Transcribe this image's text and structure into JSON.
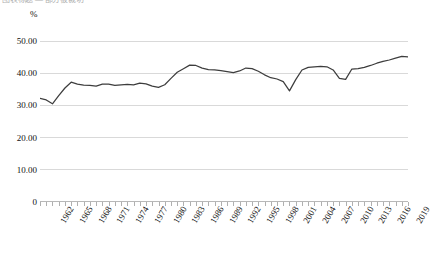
{
  "title_partial": "图表标题 — 部分被裁切",
  "axis_unit_label": "%",
  "y_labels": [
    "50.00",
    "40.00",
    "30.00",
    "20.00",
    "10.00",
    "0"
  ],
  "x_labels": [
    "1962",
    "1965",
    "1968",
    "1971",
    "1974",
    "1977",
    "1980",
    "1983",
    "1986",
    "1989",
    "1992",
    "1995",
    "1998",
    "2001",
    "2004",
    "2007",
    "2010",
    "2013",
    "2016",
    "2019"
  ],
  "colors": {
    "line": "#3d3d3d",
    "grid": "#d9d9d9",
    "axis": "#b8b8b8",
    "text": "#111111"
  },
  "chart_data": {
    "type": "line",
    "title": "",
    "xlabel": "",
    "ylabel": "%",
    "ylim": [
      0,
      50
    ],
    "ytick_values": [
      50,
      40,
      30,
      20,
      10,
      0
    ],
    "ytick_labels": [
      "50.00",
      "40.00",
      "30.00",
      "20.00",
      "10.00",
      "0"
    ],
    "grid": true,
    "grid_axis": "y",
    "legend": false,
    "xtick_interval_years": 3,
    "x": [
      1961,
      1962,
      1963,
      1964,
      1965,
      1966,
      1967,
      1968,
      1969,
      1970,
      1971,
      1972,
      1973,
      1974,
      1975,
      1976,
      1977,
      1978,
      1979,
      1980,
      1981,
      1982,
      1983,
      1984,
      1985,
      1986,
      1987,
      1988,
      1989,
      1990,
      1991,
      1992,
      1993,
      1994,
      1995,
      1996,
      1997,
      1998,
      1999,
      2000,
      2001,
      2002,
      2003,
      2004,
      2005,
      2006,
      2007,
      2008,
      2009,
      2010,
      2011,
      2012,
      2013,
      2014,
      2015,
      2016,
      2017,
      2018,
      2019,
      2020
    ],
    "values": [
      32.2,
      31.7,
      30.5,
      33.0,
      35.4,
      37.2,
      36.6,
      36.3,
      36.2,
      36.0,
      36.6,
      36.6,
      36.2,
      36.4,
      36.5,
      36.4,
      36.9,
      36.7,
      36.0,
      35.6,
      36.4,
      38.4,
      40.3,
      41.4,
      42.5,
      42.4,
      41.6,
      41.1,
      41.0,
      40.8,
      40.5,
      40.2,
      40.7,
      41.6,
      41.4,
      40.6,
      39.5,
      38.6,
      38.2,
      37.4,
      34.5,
      38.0,
      41.0,
      41.8,
      42.0,
      42.1,
      42.0,
      41.0,
      38.4,
      38.1,
      41.3,
      41.4,
      41.8,
      42.4,
      43.1,
      43.7,
      44.1,
      44.7,
      45.2,
      45.1
    ],
    "series": [
      {
        "name": "",
        "values": [
          32.2,
          31.7,
          30.5,
          33.0,
          35.4,
          37.2,
          36.6,
          36.3,
          36.2,
          36.0,
          36.6,
          36.6,
          36.2,
          36.4,
          36.5,
          36.4,
          36.9,
          36.7,
          36.0,
          35.6,
          36.4,
          38.4,
          40.3,
          41.4,
          42.5,
          42.4,
          41.6,
          41.1,
          41.0,
          40.8,
          40.5,
          40.2,
          40.7,
          41.6,
          41.4,
          40.6,
          39.5,
          38.6,
          38.2,
          37.4,
          34.5,
          38.0,
          41.0,
          41.8,
          42.0,
          42.1,
          42.0,
          41.0,
          38.4,
          38.1,
          41.3,
          41.4,
          41.8,
          42.4,
          43.1,
          43.7,
          44.1,
          44.7,
          45.2,
          45.1
        ]
      }
    ]
  }
}
